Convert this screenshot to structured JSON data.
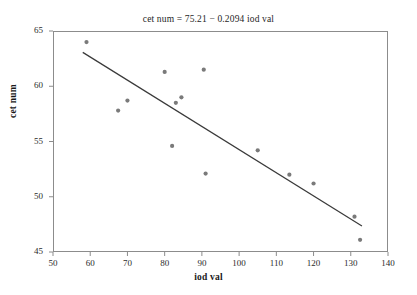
{
  "chart_data": {
    "type": "scatter",
    "title": "cet num = 75.21 − 0.2094 iod val",
    "xlabel": "iod val",
    "ylabel": "cet num",
    "xlim": [
      50,
      140
    ],
    "ylim": [
      45,
      65
    ],
    "xticks": [
      50,
      60,
      70,
      80,
      90,
      100,
      110,
      120,
      130,
      140
    ],
    "yticks": [
      45,
      50,
      55,
      60,
      65
    ],
    "grid": false,
    "legend": "none",
    "marker_color": "#7a7a7a",
    "line_color": "#3a3a3a",
    "frame_color": "#8c8c8c",
    "points": [
      {
        "x": 59.0,
        "y": 64.0
      },
      {
        "x": 67.5,
        "y": 57.8
      },
      {
        "x": 70.0,
        "y": 58.7
      },
      {
        "x": 80.0,
        "y": 61.3
      },
      {
        "x": 82.0,
        "y": 54.6
      },
      {
        "x": 83.0,
        "y": 58.5
      },
      {
        "x": 84.5,
        "y": 59.0
      },
      {
        "x": 90.5,
        "y": 61.5
      },
      {
        "x": 91.0,
        "y": 52.1
      },
      {
        "x": 105.0,
        "y": 54.2
      },
      {
        "x": 113.5,
        "y": 52.0
      },
      {
        "x": 120.0,
        "y": 51.2
      },
      {
        "x": 131.0,
        "y": 48.2
      },
      {
        "x": 132.5,
        "y": 46.1
      }
    ],
    "fit_line": {
      "equation": "cet num = 75.21 − 0.2094 iod val",
      "intercept": 75.21,
      "slope": -0.2094,
      "x_start": 58.0,
      "x_end": 133.0
    }
  }
}
